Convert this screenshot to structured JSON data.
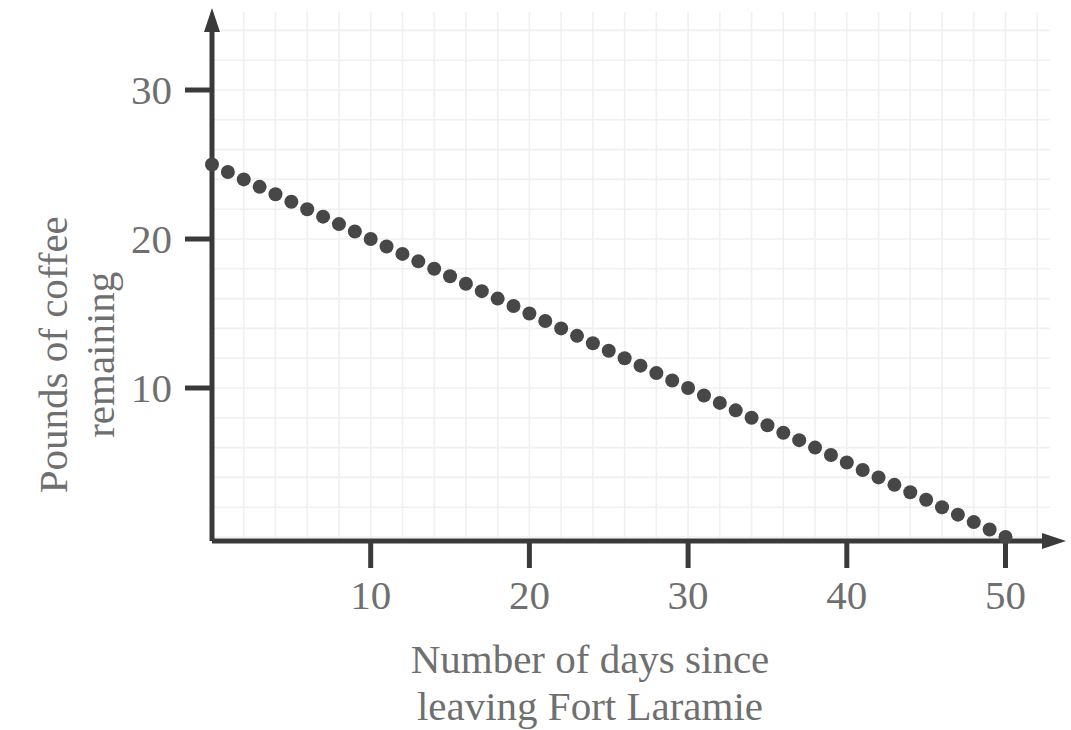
{
  "chart_data": {
    "type": "scatter",
    "title": "",
    "subtitle": "",
    "xlabel": "Number of days since leaving Fort Laramie",
    "xlabel_lines": [
      "Number of days since",
      "leaving Fort Laramie"
    ],
    "ylabel": "Pounds of coffee remaining",
    "ylabel_lines": [
      "Pounds of coffee",
      "remaining"
    ],
    "xlim": [
      0,
      53
    ],
    "ylim": [
      0,
      34
    ],
    "xticks": [
      10,
      20,
      30,
      40,
      50
    ],
    "yticks": [
      10,
      20,
      30
    ],
    "xtick_labels": [
      "10",
      "20",
      "30",
      "40",
      "50"
    ],
    "ytick_labels": [
      "10",
      "20",
      "30"
    ],
    "grid": true,
    "grid_step_x": 2,
    "grid_step_y": 2,
    "legend": null,
    "annotations": [],
    "relationship": "y = 25 - 0.5x",
    "x": [
      0,
      1,
      2,
      3,
      4,
      5,
      6,
      7,
      8,
      9,
      10,
      11,
      12,
      13,
      14,
      15,
      16,
      17,
      18,
      19,
      20,
      21,
      22,
      23,
      24,
      25,
      26,
      27,
      28,
      29,
      30,
      31,
      32,
      33,
      34,
      35,
      36,
      37,
      38,
      39,
      40,
      41,
      42,
      43,
      44,
      45,
      46,
      47,
      48,
      49,
      50
    ],
    "values": [
      25,
      24.5,
      24,
      23.5,
      23,
      22.5,
      22,
      21.5,
      21,
      20.5,
      20,
      19.5,
      19,
      18.5,
      18,
      17.5,
      17,
      16.5,
      16,
      15.5,
      15,
      14.5,
      14,
      13.5,
      13,
      12.5,
      12,
      11.5,
      11,
      10.5,
      10,
      9.5,
      9,
      8.5,
      8,
      7.5,
      7,
      6.5,
      6,
      5.5,
      5,
      4.5,
      4,
      3.5,
      3,
      2.5,
      2,
      1.5,
      1,
      0.5,
      0
    ]
  },
  "style": {
    "marker_color": "#474747",
    "axis_color": "#3a3a3a",
    "text_color": "#6f6f6f",
    "grid_color": "#f0f0f0",
    "background": "#ffffff",
    "marker_radius": 7
  }
}
